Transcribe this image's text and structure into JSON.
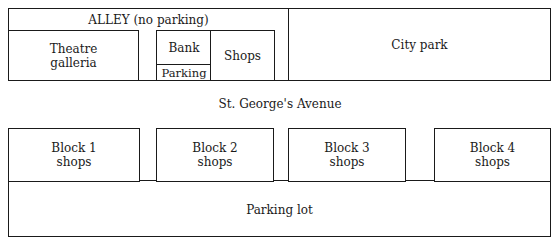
{
  "top": {
    "alley": "ALLEY (no parking)",
    "theatre": [
      "Theatre",
      "galleria"
    ],
    "bank": "Bank",
    "bank_parking": "Parking",
    "shops": "Shops",
    "park": "City park"
  },
  "street": "St. George's Avenue",
  "blocks": [
    {
      "line1": "Block 1",
      "line2": "shops"
    },
    {
      "line1": "Block 2",
      "line2": "shops"
    },
    {
      "line1": "Block 3",
      "line2": "shops"
    },
    {
      "line1": "Block 4",
      "line2": "shops"
    }
  ],
  "parking_lot": "Parking lot"
}
